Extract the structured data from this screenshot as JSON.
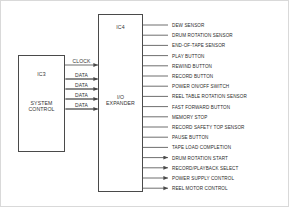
{
  "diagram": {
    "line_color": "#4a4a4a",
    "text_color": "#2b2b2b"
  },
  "blocks": {
    "ic3": {
      "ident": "IC3",
      "name_line1": "SYSTEM",
      "name_line2": "CONTROL"
    },
    "ic4": {
      "ident": "IC4",
      "name_line1": "I/O",
      "name_line2": "EXPANDER"
    }
  },
  "bus": [
    {
      "label": "CLOCK",
      "direction": "right"
    },
    {
      "label": "DATA",
      "direction": "both"
    },
    {
      "label": "DATA",
      "direction": "both"
    },
    {
      "label": "DATA",
      "direction": "both"
    },
    {
      "label": "DATA",
      "direction": "both"
    }
  ],
  "signals": [
    {
      "label": "DEW SENSOR",
      "direction": "in"
    },
    {
      "label": "DRUM ROTATION SENSOR",
      "direction": "in"
    },
    {
      "label": "END-OF-TAPE SENSOR",
      "direction": "in"
    },
    {
      "label": "PLAY BUTTON",
      "direction": "in"
    },
    {
      "label": "REWIND BUTTON",
      "direction": "in"
    },
    {
      "label": "RECORD BUTTON",
      "direction": "in"
    },
    {
      "label": "POWER ON/OFF SWITCH",
      "direction": "in"
    },
    {
      "label": "REEL TABLE ROTATION SENSOR",
      "direction": "in"
    },
    {
      "label": "FAST FORWARD BUTTON",
      "direction": "in"
    },
    {
      "label": "MEMORY STOP",
      "direction": "in"
    },
    {
      "label": "RECORD SAFETY TOP SENSOR",
      "direction": "in"
    },
    {
      "label": "PAUSE BUTTON",
      "direction": "in"
    },
    {
      "label": "TAPE LOAD COMPLETION",
      "direction": "in"
    },
    {
      "label": "DRUM ROTATION START",
      "direction": "out"
    },
    {
      "label": "RECORD/PLAYBACK SELECT",
      "direction": "out"
    },
    {
      "label": "POWER SUPPLY CONTROL",
      "direction": "out"
    },
    {
      "label": "REEL MOTOR CONTROL",
      "direction": "out"
    }
  ]
}
